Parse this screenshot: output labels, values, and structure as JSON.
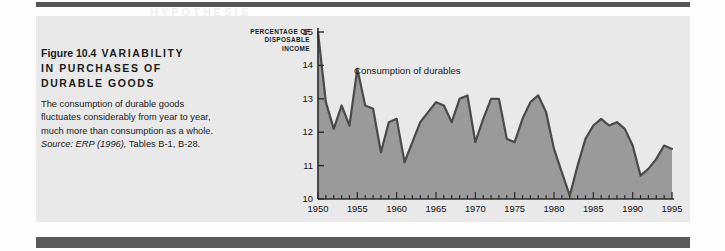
{
  "figure": {
    "number_label": "Figure 10.4",
    "title": "VARIABILITY IN PURCHASES OF DURABLE GOODS",
    "title_line1": "VARIABILITY",
    "title_line2": "IN PURCHASES OF",
    "title_line3": "DURABLE GOODS",
    "body_line1": "The consumption of durable goods",
    "body_line2": "fluctuates considerably from year to year,",
    "body_line3": "much more than consumption as a whole.",
    "source_prefix": "Source: ERP (1996),",
    "source_rest": " Tables B-1, B-28.",
    "panel_color": "#e9e9e9"
  },
  "page": {
    "ghost_text_1": "HYPOTHESIS",
    "ghost_text_2": "CONSUMPTION FUNCTION",
    "ghost_text_3": "PERMANENT INCOME"
  },
  "chart_data": {
    "type": "area",
    "title": "",
    "series_label": "Consumption of durables",
    "axis_title_lines": [
      "PERCENTAGE OF",
      "DISPOSABLE",
      "INCOME"
    ],
    "xlabel": "",
    "ylabel": "PERCENTAGE OF DISPOSABLE INCOME",
    "xlim": [
      1950,
      1995
    ],
    "ylim": [
      10,
      15
    ],
    "yticks": [
      10,
      11,
      12,
      13,
      14,
      15
    ],
    "xticks": [
      1950,
      1955,
      1960,
      1965,
      1970,
      1975,
      1980,
      1985,
      1990,
      1995
    ],
    "minor_xtick_step": 1,
    "grid": false,
    "legend_position": "inline-annotation",
    "line_color": "#4a4a4a",
    "fill_color": "#9a9a9a",
    "x": [
      1950,
      1951,
      1952,
      1953,
      1954,
      1955,
      1956,
      1957,
      1958,
      1959,
      1960,
      1961,
      1962,
      1963,
      1964,
      1965,
      1966,
      1967,
      1968,
      1969,
      1970,
      1971,
      1972,
      1973,
      1974,
      1975,
      1976,
      1977,
      1978,
      1979,
      1980,
      1981,
      1982,
      1983,
      1984,
      1985,
      1986,
      1987,
      1988,
      1989,
      1990,
      1991,
      1992,
      1993,
      1994,
      1995
    ],
    "values": [
      15.0,
      12.9,
      12.1,
      12.8,
      12.2,
      13.9,
      12.8,
      12.7,
      11.4,
      12.3,
      12.4,
      11.1,
      11.7,
      12.3,
      12.6,
      12.9,
      12.8,
      12.3,
      13.0,
      13.1,
      11.7,
      12.4,
      13.0,
      13.0,
      11.8,
      11.7,
      12.4,
      12.9,
      13.1,
      12.6,
      11.5,
      10.8,
      10.1,
      11.0,
      11.8,
      12.2,
      12.4,
      12.2,
      12.3,
      12.1,
      11.6,
      10.7,
      10.9,
      11.2,
      11.6,
      11.5
    ]
  }
}
